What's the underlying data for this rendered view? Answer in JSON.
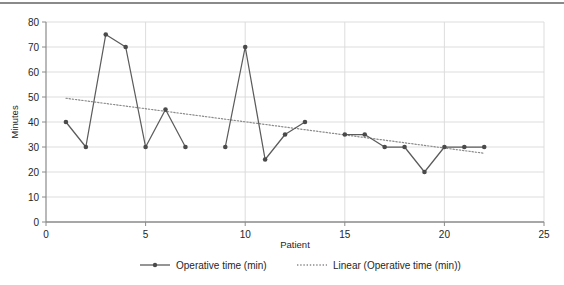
{
  "chart_data": {
    "type": "line",
    "title": "",
    "xlabel": "Patient",
    "ylabel": "Minutes",
    "xlim": [
      0,
      25
    ],
    "ylim": [
      0,
      80
    ],
    "xticks": [
      0,
      5,
      10,
      15,
      20,
      25
    ],
    "yticks": [
      0,
      10,
      20,
      30,
      40,
      50,
      60,
      70,
      80
    ],
    "grid": true,
    "legend_position": "bottom",
    "series": [
      {
        "name": "Operative time (min)",
        "marker": "circle",
        "linestyle": "solid",
        "color": "#5b5b5b",
        "x": [
          1,
          2,
          3,
          4,
          5,
          6,
          7,
          9,
          10,
          11,
          12,
          13,
          15,
          16,
          17,
          18,
          19,
          20,
          21,
          22
        ],
        "values": [
          40,
          30,
          75,
          70,
          30,
          45,
          30,
          30,
          70,
          25,
          35,
          40,
          35,
          35,
          30,
          30,
          20,
          30,
          30,
          30
        ]
      },
      {
        "name": "Linear (Operative time (min))",
        "marker": "none",
        "linestyle": "dotted",
        "color": "#8a8a8a",
        "x": [
          1,
          22
        ],
        "values": [
          49.5,
          27.5
        ]
      }
    ]
  },
  "axes": {
    "y_label": "Minutes",
    "x_label": "Patient",
    "y_tick_labels": [
      "80",
      "70",
      "60",
      "50",
      "40",
      "30",
      "20",
      "10",
      "0"
    ],
    "x_tick_labels": [
      "0",
      "5",
      "10",
      "15",
      "20",
      "25"
    ]
  },
  "legend": {
    "items": [
      {
        "label": "Operative time (min)",
        "style": "line-marker"
      },
      {
        "label": "Linear (Operative time (min))",
        "style": "dotted"
      }
    ]
  },
  "colors": {
    "series_line": "#5b5b5b",
    "trend_line": "#8a8a8a",
    "grid": "#d9d9d9",
    "axis": "#8a8a8a",
    "text": "#262626",
    "background": "#ffffff"
  }
}
